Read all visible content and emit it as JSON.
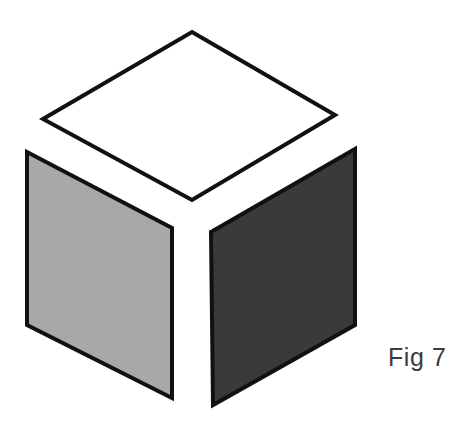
{
  "figure": {
    "caption": "Fig 7",
    "background_color": "#ffffff",
    "stroke_color": "#111111",
    "stroke_width": 4,
    "caption_color": "#3b3b3b",
    "canvas": {
      "width": 463,
      "height": 432
    },
    "faces": [
      {
        "name": "top-face",
        "label": "top face",
        "fill": "#ffffff",
        "points": "192,32 335,115 192,200 43,119"
      },
      {
        "name": "left-face",
        "label": "left face",
        "fill": "#a8a8a8",
        "points": "27,152 172,228 172,398 27,325"
      },
      {
        "name": "right-face",
        "label": "right face",
        "fill": "#3a3a3a",
        "points": "211,232 355,149 355,325 213,405"
      }
    ]
  }
}
